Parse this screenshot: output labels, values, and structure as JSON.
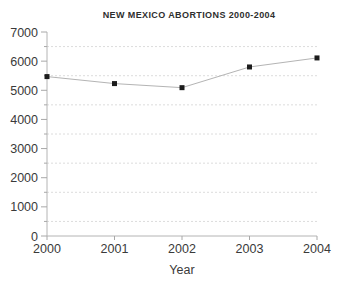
{
  "chart_data": {
    "type": "line",
    "title": "NEW MEXICO ABORTIONS 2000-2004",
    "xlabel": "Year",
    "ylabel": "",
    "categories": [
      "2000",
      "2001",
      "2002",
      "2003",
      "2004"
    ],
    "series": [
      {
        "name": "Abortions",
        "values": [
          5470,
          5230,
          5090,
          5800,
          6110
        ]
      }
    ],
    "ylim": [
      0,
      7000
    ],
    "y_major_step": 1000,
    "y_minor_step": 500,
    "y_tick_labels": [
      "0",
      "1000",
      "2000",
      "3000",
      "4000",
      "5000",
      "6000",
      "7000"
    ],
    "grid": "minor-horizontal-dashed",
    "legend_position": "none",
    "marker": "black-square",
    "colors": {
      "line": "#b4b4b4",
      "marker": "#1c1c1c",
      "grid": "#dcdcdc",
      "axis": "#b4b4b4",
      "tick": "#a8a8a8",
      "text": "#3a3a3a",
      "background": "#ffffff"
    }
  }
}
